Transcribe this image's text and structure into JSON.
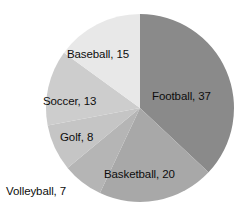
{
  "chart_data": {
    "type": "pie",
    "title": "",
    "subtitle": "",
    "xlabel": "",
    "ylabel": "",
    "legend_position": "none",
    "grid": false,
    "label_format": "name, value",
    "total": 100,
    "start_angle_deg": 0,
    "direction": "clockwise",
    "categories": [
      "Football",
      "Basketball",
      "Volleyball",
      "Golf",
      "Soccer",
      "Baseball"
    ],
    "values": [
      37,
      20,
      7,
      8,
      13,
      15
    ],
    "colors": [
      "#8a8a8a",
      "#a8a8a8",
      "#b5b5b5",
      "#c5c5c5",
      "#cdcdcd",
      "#e8e8e8"
    ],
    "slices": [
      {
        "name": "Football",
        "value": 37,
        "label": "Football, 37",
        "color": "#8a8a8a",
        "percent": 37
      },
      {
        "name": "Basketball",
        "value": 20,
        "label": "Basketball, 20",
        "color": "#a8a8a8",
        "percent": 20
      },
      {
        "name": "Volleyball",
        "value": 7,
        "label": "Volleyball, 7",
        "color": "#b5b5b5",
        "percent": 7
      },
      {
        "name": "Golf",
        "value": 8,
        "label": "Golf, 8",
        "color": "#c5c5c5",
        "percent": 8
      },
      {
        "name": "Soccer",
        "value": 13,
        "label": "Soccer, 13",
        "color": "#cdcdcd",
        "percent": 13
      },
      {
        "name": "Baseball",
        "value": 15,
        "label": "Baseball, 15",
        "color": "#e8e8e8",
        "percent": 15
      }
    ],
    "geometry": {
      "center_x": 140,
      "center_y": 108,
      "radius": 94
    }
  }
}
